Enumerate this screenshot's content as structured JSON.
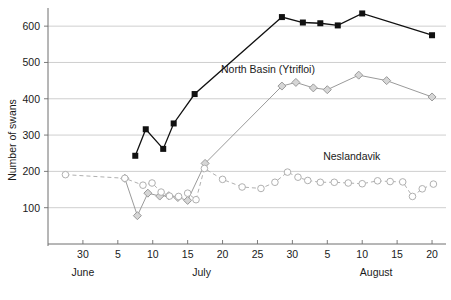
{
  "figure": {
    "y_axis_title": "Number of swans",
    "caption": ""
  },
  "chart_data": {
    "type": "line",
    "title": "",
    "xlabel": "",
    "ylabel": "Number of swans",
    "ylim": [
      0,
      650
    ],
    "y_ticks": [
      100,
      200,
      300,
      400,
      500,
      600
    ],
    "grid": true,
    "x_axis": {
      "unit": "day of year (June 25 - August 21)",
      "tick_positions_day": [
        30,
        35,
        40,
        45,
        50,
        55,
        60,
        65,
        70,
        75,
        80
      ],
      "tick_labels": [
        "30",
        "5",
        "10",
        "15",
        "20",
        "25",
        "30",
        "5",
        "10",
        "15",
        "20"
      ],
      "xlim_day": [
        25,
        82
      ],
      "months": [
        {
          "label": "June",
          "day": 30
        },
        {
          "label": "July",
          "day": 47
        },
        {
          "label": "August",
          "day": 72
        }
      ]
    },
    "legend_position": "inline-annotations",
    "series": [
      {
        "name": "Myvatn total",
        "marker": "filled-square",
        "color": "#111111",
        "line_style": "solid",
        "label_x_day": 60.5,
        "label_y_value": 680,
        "points": [
          {
            "day": 37.5,
            "value": 243
          },
          {
            "day": 39.0,
            "value": 316
          },
          {
            "day": 41.5,
            "value": 262
          },
          {
            "day": 43.0,
            "value": 332
          },
          {
            "day": 46.0,
            "value": 413
          },
          {
            "day": 58.5,
            "value": 625
          },
          {
            "day": 61.5,
            "value": 610
          },
          {
            "day": 64.0,
            "value": 608
          },
          {
            "day": 66.5,
            "value": 602
          },
          {
            "day": 70.0,
            "value": 635
          },
          {
            "day": 80.0,
            "value": 575
          }
        ]
      },
      {
        "name": "North Basin (Ytrifloi)",
        "marker": "filled-diamond",
        "color": "#9a9a9a",
        "line_style": "solid",
        "label_x_day": 56.5,
        "label_y_value": 472,
        "points": [
          {
            "day": 36.0,
            "value": 181
          },
          {
            "day": 37.8,
            "value": 78
          },
          {
            "day": 39.3,
            "value": 140
          },
          {
            "day": 41.0,
            "value": 132
          },
          {
            "day": 42.3,
            "value": 133
          },
          {
            "day": 43.6,
            "value": 128
          },
          {
            "day": 45.0,
            "value": 120
          },
          {
            "day": 47.5,
            "value": 222
          },
          {
            "day": 58.5,
            "value": 435
          },
          {
            "day": 60.5,
            "value": 445
          },
          {
            "day": 63.0,
            "value": 430
          },
          {
            "day": 65.0,
            "value": 425
          },
          {
            "day": 69.5,
            "value": 465
          },
          {
            "day": 73.5,
            "value": 450
          },
          {
            "day": 80.0,
            "value": 405
          }
        ]
      },
      {
        "name": "Neslandavik",
        "marker": "open-circle",
        "color": "#b0b0b0",
        "line_style": "dashed",
        "label_x_day": 68.5,
        "label_y_value": 232,
        "points": [
          {
            "day": 27.5,
            "value": 191
          },
          {
            "day": 36.0,
            "value": 181
          },
          {
            "day": 38.6,
            "value": 162
          },
          {
            "day": 39.9,
            "value": 168
          },
          {
            "day": 41.2,
            "value": 143
          },
          {
            "day": 42.4,
            "value": 132
          },
          {
            "day": 43.7,
            "value": 131
          },
          {
            "day": 45.0,
            "value": 140
          },
          {
            "day": 46.2,
            "value": 122
          },
          {
            "day": 47.4,
            "value": 208
          },
          {
            "day": 50.0,
            "value": 178
          },
          {
            "day": 52.8,
            "value": 157
          },
          {
            "day": 55.5,
            "value": 153
          },
          {
            "day": 57.5,
            "value": 170
          },
          {
            "day": 59.3,
            "value": 198
          },
          {
            "day": 60.8,
            "value": 184
          },
          {
            "day": 62.2,
            "value": 175
          },
          {
            "day": 64.0,
            "value": 170
          },
          {
            "day": 66.0,
            "value": 170
          },
          {
            "day": 68.0,
            "value": 168
          },
          {
            "day": 70.0,
            "value": 166
          },
          {
            "day": 72.2,
            "value": 174
          },
          {
            "day": 74.0,
            "value": 172
          },
          {
            "day": 75.8,
            "value": 171
          },
          {
            "day": 77.2,
            "value": 131
          },
          {
            "day": 78.6,
            "value": 152
          },
          {
            "day": 80.2,
            "value": 165
          }
        ]
      }
    ]
  }
}
